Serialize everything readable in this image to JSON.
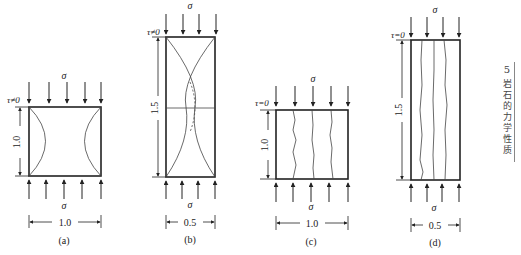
{
  "figure": {
    "panels": [
      {
        "id": "a",
        "caption": "(a)",
        "shear_label": "τ≠0",
        "stress_top": "σ",
        "stress_bottom": "σ",
        "height_label": "1.0",
        "width_label": "1.0",
        "fracture_pattern": "double-cone (hourglass) arcs"
      },
      {
        "id": "b",
        "caption": "(b)",
        "shear_label": "τ≠0",
        "stress_top": "σ",
        "stress_bottom": "σ",
        "height_label": "1.5",
        "width_label": "0.5",
        "fracture_pattern": "intersecting cones with mid line"
      },
      {
        "id": "c",
        "caption": "(c)",
        "shear_label": "τ=0",
        "stress_top": "σ",
        "stress_bottom": "σ",
        "height_label": "1.0",
        "width_label": "1.0",
        "fracture_pattern": "vertical splitting cracks"
      },
      {
        "id": "d",
        "caption": "(d)",
        "shear_label": "τ=0",
        "stress_top": "σ",
        "stress_bottom": "σ",
        "height_label": "1.5",
        "width_label": "0.5",
        "fracture_pattern": "vertical splitting cracks"
      }
    ],
    "side_tab": {
      "chapter_number": "5",
      "chapter_title": "岩石的力学性质"
    },
    "colors": {
      "line": "#333333",
      "background": "#ffffff"
    }
  }
}
